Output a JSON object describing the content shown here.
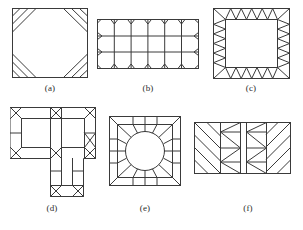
{
  "page": {
    "kind": "technical-line-drawing-figure-panel",
    "background_color": "#ffffff",
    "stroke_color": "#3a3a3a",
    "label_color": "#2b2b2b"
  },
  "figures": [
    {
      "id": "a",
      "label": "(a)",
      "caption": "(a)",
      "description": "Square domain with an octagonal inner region; each of the four corners is a triangle subdivided by two parallel diagonal stripes",
      "shape": "square",
      "outer_width": 76,
      "outer_height": 70,
      "corner_cut": 24,
      "stripes_per_corner": 2
    },
    {
      "id": "b",
      "label": "(b)",
      "caption": "(b)",
      "description": "Rectangular domain meshed into a structured grid of 3 rows by 6 columns with small triangular notch elements at every boundary node",
      "shape": "rectangle",
      "outer_width": 102,
      "outer_height": 50,
      "rows": 3,
      "columns": 6,
      "boundary_notches": true
    },
    {
      "id": "c",
      "label": "(c)",
      "caption": "(c)",
      "description": "Square annular band of alternating zigzag triangles surrounding an empty square inner region",
      "shape": "square-annulus",
      "outer_width": 77,
      "outer_height": 71,
      "band_thickness": 12,
      "zigzags_top": 5,
      "zigzags_side": 5
    },
    {
      "id": "d",
      "label": "(d)",
      "caption": "(d)",
      "description": "L-shaped (stepped) domain with a uniform boundary band and diagonal triangular elements placed at every convex and concave corner",
      "shape": "L-shape",
      "outer_width": 86,
      "outer_height": 90,
      "band_thickness": 11
    },
    {
      "id": "e",
      "label": "(e)",
      "caption": "(e)",
      "description": "Rectangular plate with a central circular hole; the annular region is meshed with radial quadrilateral cells and diagonal corner elements",
      "shape": "rectangle-with-circular-hole",
      "outer_width": 72,
      "outer_height": 70,
      "hole_radius": 20,
      "radial_cells": 12
    },
    {
      "id": "f",
      "label": "(f)",
      "caption": "(f)",
      "description": "Rectangular domain split into four vertical blocks: outer blocks carry parallel diagonal stripes, inner blocks carry nested zigzag triangle elements",
      "shape": "rectangle",
      "outer_width": 97,
      "outer_height": 52,
      "blocks": 4
    }
  ]
}
